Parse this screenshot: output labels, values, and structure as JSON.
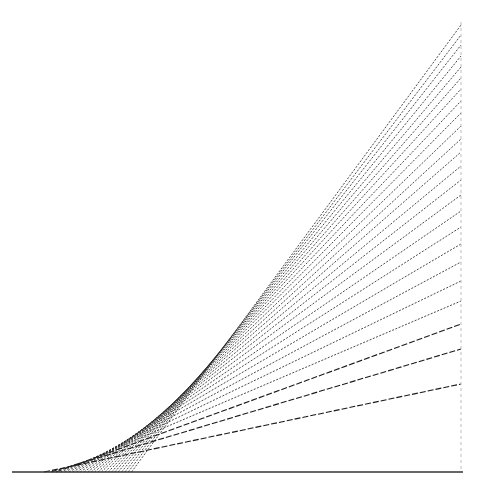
{
  "figure": {
    "title": "",
    "background": "#ffffff",
    "line_color": "#1a1a1a",
    "baseline": {
      "x1": 12,
      "x2": 463,
      "y": 472
    },
    "right_edge": {
      "x": 461,
      "y_top": 22,
      "y_bottom": 472,
      "style": "dashed-light"
    },
    "curve": {
      "type": "quadratic-tangents",
      "origin_x": 28,
      "origin_y": 472,
      "coefficient": 0.003277,
      "max_tangent_offset": 207,
      "line_count": 24
    },
    "right_edge_endpoints_y": [
      25,
      35,
      45,
      56,
      67,
      78,
      89,
      101,
      113,
      126,
      139,
      152,
      166,
      180,
      195,
      211,
      227,
      244,
      262,
      281,
      301,
      324,
      349,
      384
    ]
  }
}
